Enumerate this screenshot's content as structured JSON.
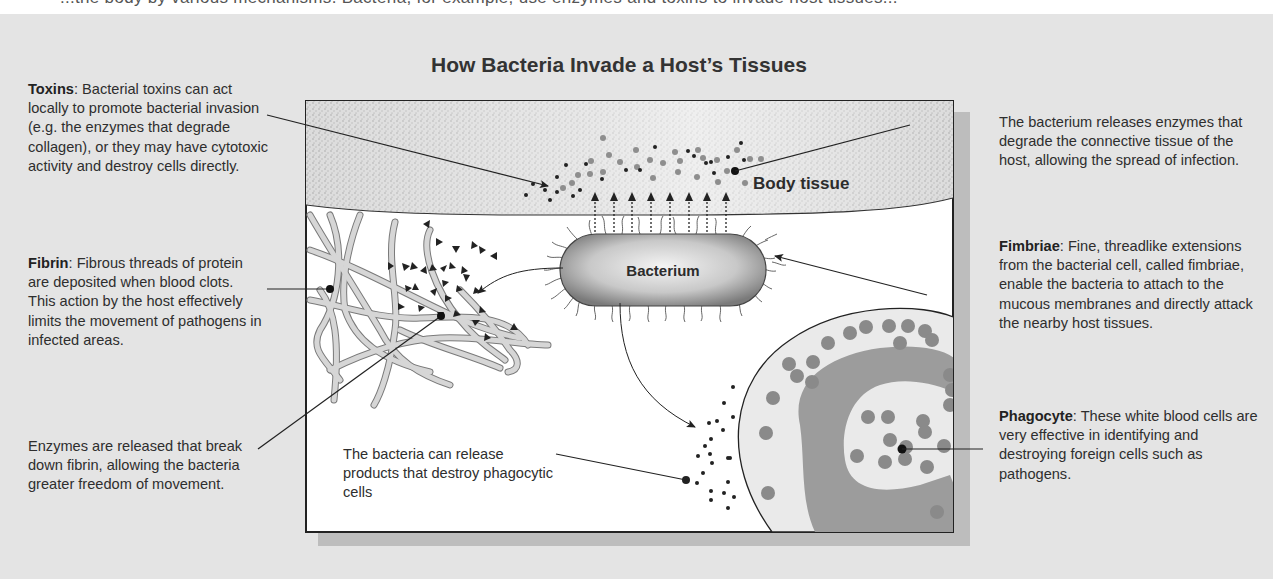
{
  "top_strip_text": "...the body by various mechanisms. Bacteria, for example, use enzymes and toxins to invade host tissues...",
  "title": "How Bacteria Invade a Host’s Tissues",
  "diagram_labels": {
    "body_tissue": "Body tissue",
    "bacterium": "Bacterium",
    "phagocyte_products": "The bacteria can release products that destroy phagocytic cells"
  },
  "callouts": {
    "toxins": {
      "term": "Toxins",
      "text": ":  Bacterial toxins can act locally to promote bacterial invasion (e.g. the enzymes that degrade collagen), or they may have cytotoxic activity and destroy cells directly."
    },
    "fibrin": {
      "term": "Fibrin",
      "text": ":  Fibrous threads of protein are deposited when blood clots. This action by the host effectively limits the movement of pathogens in infected areas."
    },
    "enzymes_fibrin": {
      "text": "Enzymes are released that break down fibrin, allowing the bacteria greater freedom of movement."
    },
    "enzymes_tissue": {
      "text": "The bacterium releases enzymes that degrade the connective tissue of the host, allowing the spread of infection."
    },
    "fimbriae": {
      "term": "Fimbriae",
      "text": ":  Fine, threadlike extensions from the bacterial cell, called fimbriae, enable the bacteria to attach to the mucous membranes and directly attack the nearby host tissues."
    },
    "phagocyte": {
      "term": "Phagocyte",
      "text": ": These white blood cells are very effective in identifying and destroying foreign cells such as pathogens."
    }
  },
  "colors": {
    "background": "#e4e4e4",
    "box_fill": "#ffffff",
    "tissue_fill": "#d4d4d4",
    "phagocyte_fill": "#e9e9e9",
    "nucleus_fill": "#9a9a9a",
    "granule_fill": "#8c8c8c",
    "fibrin_fill": "#cfcfcf",
    "dark": "#222222"
  }
}
